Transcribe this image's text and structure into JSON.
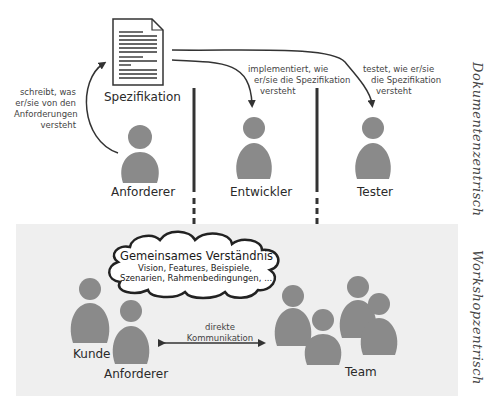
{
  "document": {
    "label": "Spezifikation"
  },
  "top_section": {
    "side_label": "Dokumentenzentrisch",
    "roles": [
      {
        "name": "Anforderer"
      },
      {
        "name": "Entwickler"
      },
      {
        "name": "Tester"
      }
    ],
    "arrows": {
      "writes": [
        "schreibt, was",
        "er/sie von den",
        "Anforderungen",
        "versteht"
      ],
      "implements": [
        "implementiert, wie",
        "er/sie die Spezifikation",
        "versteht"
      ],
      "tests": [
        "testet, wie er/sie",
        "die Spezifikation",
        "versteht"
      ]
    }
  },
  "bottom_section": {
    "side_label": "Workshopzentrisch",
    "cloud": {
      "title": "Gemeinsames Verständnis",
      "line1": "Vision, Features, Beispiele,",
      "line2": "Szenarien, Rahmenbedingungen, ..."
    },
    "roles": {
      "kunde": "Kunde",
      "anforderer": "Anforderer",
      "team": "Team"
    },
    "communication": [
      "direkte",
      "Kommunikation"
    ]
  },
  "colors": {
    "person": "#8a8a8a",
    "line": "#333333",
    "band": "#efefef"
  }
}
